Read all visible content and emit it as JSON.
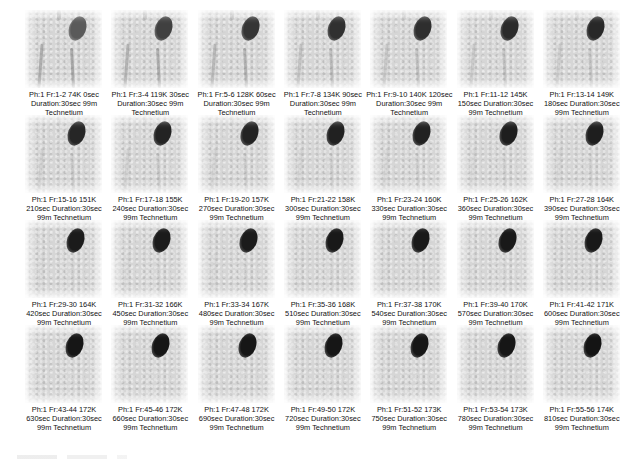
{
  "figure": {
    "columns": 7,
    "rows": 4,
    "colors": {
      "background": "#ffffff",
      "panel_background": "#d6d6d6",
      "hotspot": "#1e1e1e",
      "caption_text": "#111111"
    },
    "frames": [
      {
        "line1": "Ph:1 Fr:1-2 74K 0sec",
        "line2": "Duration:30sec 99m",
        "line3": "Technetium",
        "intensity": 0.72,
        "vessels": 1.0
      },
      {
        "line1": "Ph:1 Fr:3-4 119K 30sec",
        "line2": "Duration:30sec 99m",
        "line3": "Technetium",
        "intensity": 0.82,
        "vessels": 0.9
      },
      {
        "line1": "Ph:1 Fr:5-6 128K 60sec",
        "line2": "Duration:30sec 99m",
        "line3": "Technetium",
        "intensity": 0.86,
        "vessels": 0.8
      },
      {
        "line1": "Ph:1 Fr:7-8 134K 90sec",
        "line2": "Duration:30sec 99m",
        "line3": "Technetium",
        "intensity": 0.88,
        "vessels": 0.6
      },
      {
        "line1": "Ph:1 Fr:9-10 140K 120sec",
        "line2": "Duration:30sec 99m",
        "line3": "Technetium",
        "intensity": 0.89,
        "vessels": 0.5
      },
      {
        "line1": "Ph:1 Fr:11-12 145K",
        "line2": "150sec Duration:30sec",
        "line3": "99m Technetium",
        "intensity": 0.9,
        "vessels": 0.45
      },
      {
        "line1": "Ph:1 Fr:13-14 149K",
        "line2": "180sec Duration:30sec",
        "line3": "99m Technetium",
        "intensity": 0.91,
        "vessels": 0.4
      },
      {
        "line1": "Ph:1 Fr:15-16 151K",
        "line2": "210sec Duration:30sec",
        "line3": "99m Technetium",
        "intensity": 0.92,
        "vessels": 0.3
      },
      {
        "line1": "Ph:1 Fr:17-18 155K",
        "line2": "240sec Duration:30sec",
        "line3": "99m Technetium",
        "intensity": 0.93,
        "vessels": 0.3
      },
      {
        "line1": "Ph:1 Fr:19-20 157K",
        "line2": "270sec Duration:30sec",
        "line3": "99m Technetium",
        "intensity": 0.93,
        "vessels": 0.25
      },
      {
        "line1": "Ph:1 Fr:21-22 158K",
        "line2": "300sec Duration:30sec",
        "line3": "99m Technetium",
        "intensity": 0.94,
        "vessels": 0.2
      },
      {
        "line1": "Ph:1 Fr:23-24 160K",
        "line2": "330sec Duration:30sec",
        "line3": "99m Technetium",
        "intensity": 0.94,
        "vessels": 0.2
      },
      {
        "line1": "Ph:1 Fr:25-26 162K",
        "line2": "360sec Duration:30sec",
        "line3": "99m Technetium",
        "intensity": 0.95,
        "vessels": 0.15
      },
      {
        "line1": "Ph:1 Fr:27-28 164K",
        "line2": "390sec Duration:30sec",
        "line3": "99m Technetium",
        "intensity": 0.95,
        "vessels": 0.15
      },
      {
        "line1": "Ph:1 Fr:29-30 164K",
        "line2": "420sec Duration:30sec",
        "line3": "99m Technetium",
        "intensity": 0.96,
        "vessels": 0.1
      },
      {
        "line1": "Ph:1 Fr:31-32 166K",
        "line2": "450sec Duration:30sec",
        "line3": "99m Technetium",
        "intensity": 0.96,
        "vessels": 0.1
      },
      {
        "line1": "Ph:1 Fr:33-34 167K",
        "line2": "480sec Duration:30sec",
        "line3": "99m Technetium",
        "intensity": 0.96,
        "vessels": 0.1
      },
      {
        "line1": "Ph:1 Fr:35-36 168K",
        "line2": "510sec Duration:30sec",
        "line3": "99m Technetium",
        "intensity": 0.97,
        "vessels": 0.05
      },
      {
        "line1": "Ph:1 Fr:37-38 170K",
        "line2": "540sec Duration:30sec",
        "line3": "99m Technetium",
        "intensity": 0.97,
        "vessels": 0.05
      },
      {
        "line1": "Ph:1 Fr:39-40 170K",
        "line2": "570sec Duration:30sec",
        "line3": "99m Technetium",
        "intensity": 0.97,
        "vessels": 0.05
      },
      {
        "line1": "Ph:1 Fr:41-42 171K",
        "line2": "600sec Duration:30sec",
        "line3": "99m Technetium",
        "intensity": 0.97,
        "vessels": 0.05
      },
      {
        "line1": "Ph:1 Fr:43-44 172K",
        "line2": "630sec Duration:30sec",
        "line3": "99m Technetium",
        "intensity": 0.98,
        "vessels": 0.0
      },
      {
        "line1": "Ph:1 Fr:45-46 172K",
        "line2": "660sec Duration:30sec",
        "line3": "99m Technetium",
        "intensity": 0.98,
        "vessels": 0.0
      },
      {
        "line1": "Ph:1 Fr:47-48 172K",
        "line2": "690sec Duration:30sec",
        "line3": "99m Technetium",
        "intensity": 0.98,
        "vessels": 0.0
      },
      {
        "line1": "Ph:1 Fr:49-50 172K",
        "line2": "720sec Duration:30sec",
        "line3": "99m Technetium",
        "intensity": 0.98,
        "vessels": 0.0
      },
      {
        "line1": "Ph:1 Fr:51-52 173K",
        "line2": "750sec Duration:30sec",
        "line3": "99m Technetium",
        "intensity": 0.98,
        "vessels": 0.0
      },
      {
        "line1": "Ph:1 Fr:53-54 173K",
        "line2": "780sec Duration:30sec",
        "line3": "99m Technetium",
        "intensity": 0.98,
        "vessels": 0.0
      },
      {
        "line1": "Ph:1 Fr:55-56 174K",
        "line2": "810sec Duration:30sec",
        "line3": "99m Technetium",
        "intensity": 0.99,
        "vessels": 0.0
      }
    ]
  }
}
